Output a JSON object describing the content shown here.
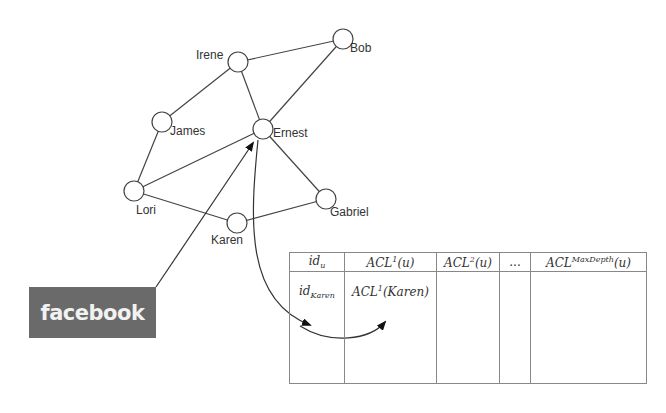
{
  "graph": {
    "nodes": [
      {
        "id": "irene",
        "label": "Irene",
        "x": 238,
        "y": 62
      },
      {
        "id": "bob",
        "label": "Bob",
        "x": 343,
        "y": 39
      },
      {
        "id": "james",
        "label": "James",
        "x": 162,
        "y": 122
      },
      {
        "id": "ernest",
        "label": "Ernest",
        "x": 263,
        "y": 129
      },
      {
        "id": "lori",
        "label": "Lori",
        "x": 134,
        "y": 191
      },
      {
        "id": "karen",
        "label": "Karen",
        "x": 237,
        "y": 223
      },
      {
        "id": "gabriel",
        "label": "Gabriel",
        "x": 326,
        "y": 199
      }
    ],
    "edges": [
      [
        "irene",
        "bob"
      ],
      [
        "irene",
        "james"
      ],
      [
        "irene",
        "ernest"
      ],
      [
        "bob",
        "ernest"
      ],
      [
        "james",
        "lori"
      ],
      [
        "lori",
        "ernest"
      ],
      [
        "lori",
        "karen"
      ],
      [
        "karen",
        "gabriel"
      ],
      [
        "ernest",
        "gabriel"
      ]
    ]
  },
  "source_box": {
    "label": "facebook",
    "color": "#6a6a6a"
  },
  "table": {
    "headers": {
      "col1": {
        "base": "id",
        "sub": "u"
      },
      "col2": {
        "base": "ACL",
        "sup": "1",
        "arg": "(u)"
      },
      "col3": {
        "base": "ACL",
        "sup": "2",
        "arg": "(u)"
      },
      "col4": {
        "text": "..."
      },
      "col5": {
        "base": "ACL",
        "sup": "MaxDepth",
        "arg": "(u)"
      }
    },
    "row": {
      "col1": {
        "base": "id",
        "sub": "Karen"
      },
      "col2": {
        "base": "ACL",
        "sup": "1",
        "arg": "(Karen)"
      }
    }
  }
}
